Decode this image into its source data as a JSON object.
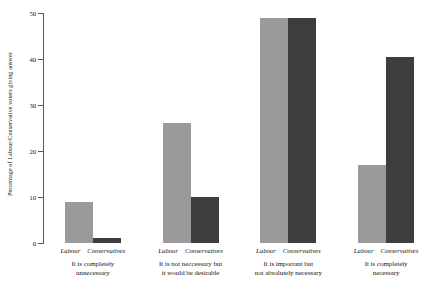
{
  "chart_data": {
    "type": "bar",
    "title": "",
    "xlabel": "",
    "ylabel": "Percentage of Labour/Conservative voters giving answer",
    "ylim": [
      0,
      50
    ],
    "yticks": [
      0,
      10,
      20,
      30,
      40,
      50
    ],
    "ytick_labels": [
      "0",
      "10",
      "20",
      "30",
      "40",
      "50"
    ],
    "grid": false,
    "legend_position": "none",
    "categories": [
      "It is completely unnecessary",
      "It is not neccessary but it would be desirable",
      "It is important but not absolutely necessary",
      "It is completely necessary"
    ],
    "category_lines": [
      [
        "It is completely",
        "unnecessary"
      ],
      [
        "It is not neccessary but",
        "it would be desirable"
      ],
      [
        "It is important but",
        "not absolutely necessary"
      ],
      [
        "It is completely",
        "necessary"
      ]
    ],
    "series": [
      {
        "name": "Labour",
        "color": "#9a9a9a",
        "values": [
          9,
          26,
          49,
          17
        ]
      },
      {
        "name": "Conservatives",
        "color": "#3d3d3d",
        "values": [
          1,
          10,
          49,
          40.5
        ]
      }
    ]
  },
  "axis": {
    "y_title": "Percentage of Labour/Conservative voters giving answer"
  }
}
